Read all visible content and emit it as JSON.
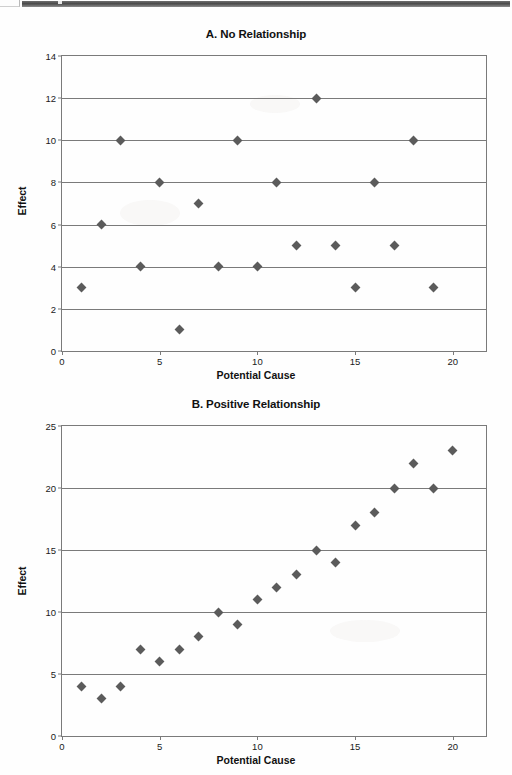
{
  "page": {
    "background_color": "#fefefe",
    "marker_color": "#5b5b5b",
    "axis_color": "#7a7a7a",
    "text_color": "#111111"
  },
  "chart_data": [
    {
      "type": "scatter",
      "panel": "A",
      "title": "A. No Relationship",
      "xlabel": "Potential Cause",
      "ylabel": "Effect",
      "xlim": [
        0,
        21.7
      ],
      "ylim": [
        0,
        14
      ],
      "xticks": [
        0,
        5,
        10,
        15,
        20
      ],
      "yticks": [
        0,
        2,
        4,
        6,
        8,
        10,
        12,
        14
      ],
      "grid": true,
      "legend": "none",
      "x": [
        1,
        2,
        3,
        4,
        5,
        6,
        7,
        8,
        9,
        10,
        11,
        12,
        13,
        14,
        15,
        16,
        17,
        18,
        19
      ],
      "y": [
        3,
        6,
        10,
        4,
        8,
        1,
        7,
        4,
        10,
        4,
        8,
        5,
        12,
        5,
        3,
        8,
        5,
        10,
        3
      ]
    },
    {
      "type": "scatter",
      "panel": "B",
      "title": "B. Positive Relationship",
      "xlabel": "Potential Cause",
      "ylabel": "Effect",
      "xlim": [
        0,
        21.7
      ],
      "ylim": [
        0,
        25
      ],
      "xticks": [
        0,
        5,
        10,
        15,
        20
      ],
      "yticks": [
        0,
        5,
        10,
        15,
        20,
        25
      ],
      "grid": true,
      "legend": "none",
      "x": [
        1,
        2,
        3,
        4,
        5,
        6,
        7,
        8,
        9,
        10,
        11,
        12,
        13,
        14,
        15,
        16,
        17,
        18,
        19,
        20
      ],
      "y": [
        4,
        3,
        4,
        7,
        6,
        7,
        8,
        10,
        9,
        11,
        12,
        13,
        15,
        14,
        17,
        18,
        20,
        22,
        20,
        23
      ]
    }
  ]
}
